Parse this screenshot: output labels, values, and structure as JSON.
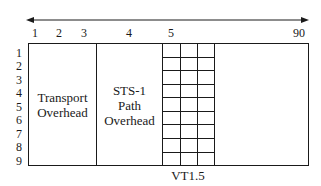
{
  "diagram": {
    "column_axis": {
      "labels": [
        {
          "text": "1",
          "x": 35
        },
        {
          "text": "2",
          "x": 59
        },
        {
          "text": "3",
          "x": 84
        },
        {
          "text": "4",
          "x": 129
        },
        {
          "text": "5",
          "x": 171
        },
        {
          "text": "90",
          "x": 299
        }
      ]
    },
    "row_labels": [
      "1",
      "2",
      "3",
      "4",
      "5",
      "6",
      "7",
      "8",
      "9"
    ],
    "regions": {
      "transport_overhead": "Transport\nOverhead",
      "path_overhead": "STS-1\nPath\nOverhead"
    },
    "vt_label": "VT1.5",
    "vt_grid": {
      "columns": 3,
      "rows": 9
    },
    "colors": {
      "line": "#1a1a1a",
      "background": "#ffffff"
    }
  }
}
